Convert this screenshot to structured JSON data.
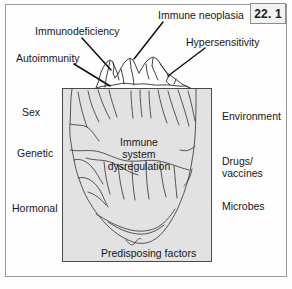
{
  "figure": {
    "number": "22. 1",
    "badge_name": "figure-number-badge"
  },
  "colors": {
    "frame_border": "#9a9a9a",
    "box_fill": "#e2e2e2",
    "box_border": "#4a4a4a",
    "ink": "#171717",
    "line": "#2b2b2b",
    "badge_fill": "#f2f2f2"
  },
  "above_water_labels": [
    {
      "id": "immunodeficiency",
      "text": "Immunodeficiency"
    },
    {
      "id": "autoimmunity",
      "text": "Autoimmunity"
    },
    {
      "id": "immune-neoplasia",
      "text": "Immune neoplasia"
    },
    {
      "id": "hypersensitivity",
      "text": "Hypersensitivity"
    }
  ],
  "left_labels": [
    {
      "id": "sex",
      "text": "Sex"
    },
    {
      "id": "genetic",
      "text": "Genetic"
    },
    {
      "id": "hormonal",
      "text": "Hormonal"
    }
  ],
  "right_labels": [
    {
      "id": "environment",
      "text": "Environment"
    },
    {
      "id": "drugs",
      "text": "Drugs/"
    },
    {
      "id": "vaccines",
      "text": "vaccines"
    },
    {
      "id": "microbes",
      "text": "Microbes"
    }
  ],
  "core_label": {
    "line1": "Immune system",
    "line2": "dysregulation"
  },
  "bottom_label": {
    "text": "Predisposing factors"
  }
}
